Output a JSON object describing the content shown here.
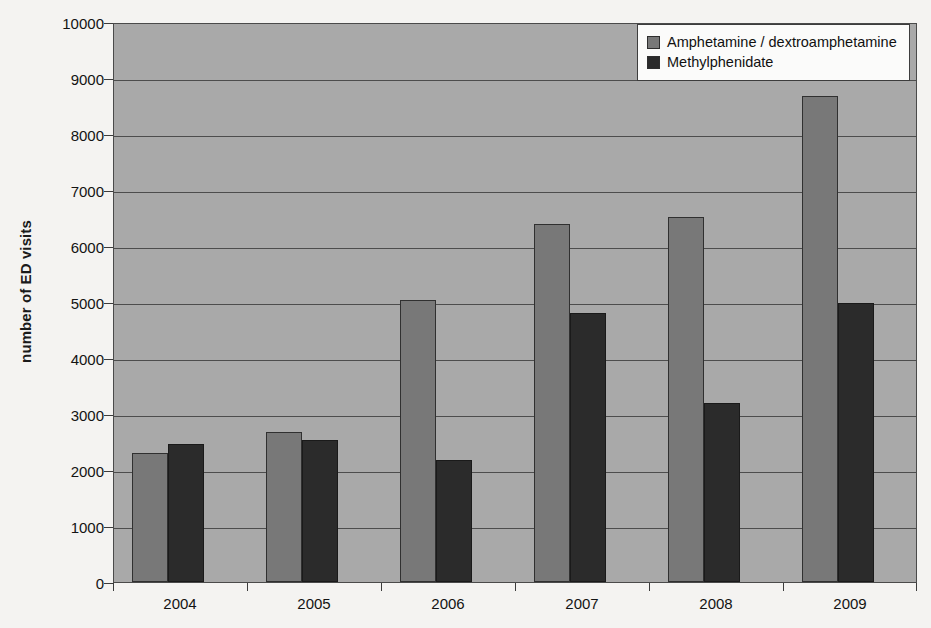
{
  "chart_data": {
    "type": "bar",
    "title": "",
    "xlabel": "",
    "ylabel": "number of ED visits",
    "categories": [
      "2004",
      "2005",
      "2006",
      "2007",
      "2008",
      "2009"
    ],
    "series": [
      {
        "name": "Amphetamine / dextroamphetamine",
        "color": "#787878",
        "values": [
          2310,
          2670,
          5030,
          6390,
          6510,
          8670
        ]
      },
      {
        "name": "Methylphenidate",
        "color": "#2b2b2b",
        "values": [
          2460,
          2540,
          2170,
          4800,
          3190,
          4990
        ]
      }
    ],
    "ylim": [
      0,
      10000
    ],
    "ytick_step": 1000,
    "yticks": [
      "0",
      "1000",
      "2000",
      "3000",
      "4000",
      "5000",
      "6000",
      "7000",
      "8000",
      "9000",
      "10000"
    ],
    "grid": true,
    "legend_position": "top-right",
    "plot_background": "#a9a9a9",
    "page_background": "#f4f3f1"
  },
  "legend": {
    "entries": [
      {
        "label": "Amphetamine / dextroamphetamine",
        "swatch": "#787878"
      },
      {
        "label": "Methylphenidate",
        "swatch": "#2b2b2b"
      }
    ]
  }
}
